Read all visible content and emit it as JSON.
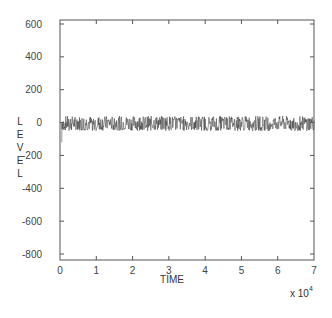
{
  "chart_data": {
    "type": "line",
    "title": "",
    "xlabel": "TIME",
    "ylabel": "LEVEL",
    "x_multiplier": "x 10^4",
    "x_multiplier_base": "x 10",
    "x_multiplier_exp": "4",
    "xlim": [
      0,
      7
    ],
    "ylim": [
      -800,
      600
    ],
    "xticks": [
      "0",
      "1",
      "2",
      "3",
      "4",
      "5",
      "6",
      "7"
    ],
    "yticks": [
      "600",
      "400",
      "200",
      "0",
      "-200",
      "-400",
      "-600",
      "-800"
    ],
    "grid": false,
    "legend": null,
    "series": [
      {
        "name": "level",
        "description": "Dense noisy signal oscillating around 0 across full time range, amplitude roughly -50 to +40",
        "x_range": [
          0.05,
          7.0
        ],
        "mean": 0,
        "min": -50,
        "max": 40,
        "color": "#333333"
      }
    ]
  }
}
